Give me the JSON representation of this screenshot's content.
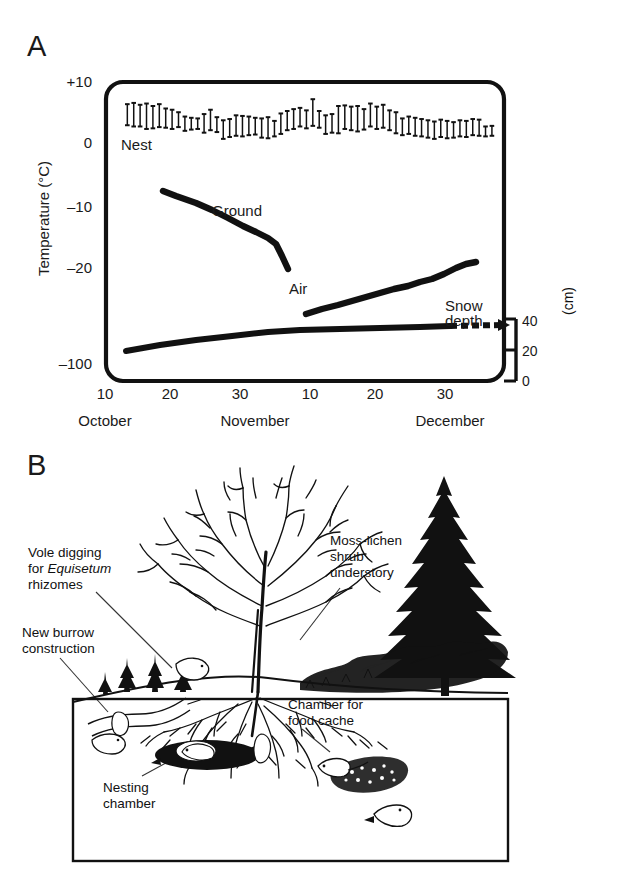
{
  "figure": {
    "panels": [
      {
        "id": "A",
        "letter": "A"
      },
      {
        "id": "B",
        "letter": "B"
      }
    ]
  },
  "panelA": {
    "letter": "A",
    "ylabel": "Temperature (°C)",
    "y_ticks": [
      "+10",
      "0",
      "–10",
      "–20",
      "–100"
    ],
    "x_ticks": [
      "10",
      "20",
      "30",
      "10",
      "20",
      "30"
    ],
    "x_months": [
      "October",
      "November",
      "December"
    ],
    "series_labels": {
      "nest": "Nest",
      "ground": "Ground",
      "air": "Air",
      "snow": "Snow depth"
    },
    "right_axis": {
      "unit": "(cm)",
      "ticks": [
        "40",
        "20",
        "0"
      ]
    }
  },
  "panelB": {
    "letter": "B",
    "labels": {
      "vole_digging_line1": "Vole digging",
      "vole_digging_line2_pre": "for ",
      "vole_digging_line2_em": "Equisetum",
      "vole_digging_line3": "rhizomes",
      "new_burrow_line1": "New burrow",
      "new_burrow_line2": "construction",
      "moss_line1": "Moss-lichen",
      "moss_line2": "shrub",
      "moss_line3": "understory",
      "chamber_line1": "Chamber for",
      "chamber_line2": "food cache",
      "nesting_line1": "Nesting",
      "nesting_line2": "chamber"
    }
  },
  "colors": {
    "ink": "#111111",
    "background": "#ffffff"
  },
  "chart_data": {
    "type": "line",
    "title": "",
    "xlabel": "",
    "ylabel": "Temperature (°C)",
    "ylim": [
      -100,
      10
    ],
    "y_tick_values": [
      10,
      0,
      -10,
      -20,
      -100
    ],
    "y_tick_labels": [
      "+10",
      "0",
      "–10",
      "–20",
      "–100"
    ],
    "x_tick_labels": [
      "10",
      "20",
      "30",
      "10",
      "20",
      "30"
    ],
    "x_tick_days": [
      10,
      20,
      30,
      41,
      51,
      61
    ],
    "x_month_labels": [
      "October",
      "November",
      "December"
    ],
    "xlim": [
      10,
      66
    ],
    "grid": false,
    "legend": "inline-annotations",
    "series": [
      {
        "name": "Nest",
        "type": "errorbar-range",
        "note": "daily minimum–maximum nest temperature, degrees C",
        "points": [
          {
            "x": 13.0,
            "low": 4.8,
            "high": 8.2
          },
          {
            "x": 13.9,
            "low": 4.6,
            "high": 8.4
          },
          {
            "x": 14.8,
            "low": 4.6,
            "high": 8.1
          },
          {
            "x": 15.7,
            "low": 4.2,
            "high": 8.3
          },
          {
            "x": 16.6,
            "low": 4.3,
            "high": 7.9
          },
          {
            "x": 17.5,
            "low": 4.5,
            "high": 8.2
          },
          {
            "x": 18.4,
            "low": 4.4,
            "high": 7.5
          },
          {
            "x": 19.3,
            "low": 4.2,
            "high": 7.3
          },
          {
            "x": 20.2,
            "low": 4.5,
            "high": 6.9
          },
          {
            "x": 21.1,
            "low": 3.9,
            "high": 6.2
          },
          {
            "x": 22.0,
            "low": 4.1,
            "high": 6.0
          },
          {
            "x": 22.9,
            "low": 4.2,
            "high": 5.9
          },
          {
            "x": 23.8,
            "low": 3.6,
            "high": 6.6
          },
          {
            "x": 24.7,
            "low": 4.0,
            "high": 7.3
          },
          {
            "x": 25.6,
            "low": 3.7,
            "high": 6.1
          },
          {
            "x": 26.5,
            "low": 2.6,
            "high": 5.6
          },
          {
            "x": 27.4,
            "low": 2.9,
            "high": 5.8
          },
          {
            "x": 28.3,
            "low": 3.1,
            "high": 6.4
          },
          {
            "x": 29.2,
            "low": 3.0,
            "high": 6.3
          },
          {
            "x": 30.1,
            "low": 3.2,
            "high": 6.2
          },
          {
            "x": 31.0,
            "low": 3.3,
            "high": 6.0
          },
          {
            "x": 31.9,
            "low": 2.8,
            "high": 5.9
          },
          {
            "x": 32.8,
            "low": 2.7,
            "high": 6.1
          },
          {
            "x": 33.7,
            "low": 3.0,
            "high": 5.5
          },
          {
            "x": 34.6,
            "low": 3.4,
            "high": 6.7
          },
          {
            "x": 35.5,
            "low": 4.0,
            "high": 7.1
          },
          {
            "x": 36.4,
            "low": 4.2,
            "high": 7.4
          },
          {
            "x": 37.3,
            "low": 4.6,
            "high": 7.6
          },
          {
            "x": 38.2,
            "low": 4.3,
            "high": 7.2
          },
          {
            "x": 39.1,
            "low": 4.7,
            "high": 9.0
          },
          {
            "x": 40.0,
            "low": 4.4,
            "high": 7.1
          },
          {
            "x": 40.9,
            "low": 3.4,
            "high": 6.4
          },
          {
            "x": 41.8,
            "low": 3.6,
            "high": 6.6
          },
          {
            "x": 42.7,
            "low": 3.5,
            "high": 7.9
          },
          {
            "x": 43.6,
            "low": 4.2,
            "high": 8.0
          },
          {
            "x": 44.5,
            "low": 4.0,
            "high": 7.8
          },
          {
            "x": 45.4,
            "low": 3.8,
            "high": 7.9
          },
          {
            "x": 46.3,
            "low": 4.1,
            "high": 7.4
          },
          {
            "x": 47.2,
            "low": 4.6,
            "high": 8.3
          },
          {
            "x": 48.1,
            "low": 4.2,
            "high": 7.8
          },
          {
            "x": 49.0,
            "low": 4.4,
            "high": 8.1
          },
          {
            "x": 49.9,
            "low": 4.0,
            "high": 7.2
          },
          {
            "x": 50.8,
            "low": 3.5,
            "high": 6.9
          },
          {
            "x": 51.7,
            "low": 3.2,
            "high": 5.9
          },
          {
            "x": 52.6,
            "low": 3.4,
            "high": 6.2
          },
          {
            "x": 53.5,
            "low": 3.1,
            "high": 6.0
          },
          {
            "x": 54.4,
            "low": 3.0,
            "high": 5.8
          },
          {
            "x": 55.3,
            "low": 2.8,
            "high": 5.6
          },
          {
            "x": 56.2,
            "low": 2.6,
            "high": 5.4
          },
          {
            "x": 57.1,
            "low": 2.9,
            "high": 5.7
          },
          {
            "x": 58.0,
            "low": 2.7,
            "high": 5.5
          },
          {
            "x": 58.9,
            "low": 2.8,
            "high": 5.3
          },
          {
            "x": 59.8,
            "low": 3.0,
            "high": 5.6
          },
          {
            "x": 60.7,
            "low": 2.9,
            "high": 5.5
          },
          {
            "x": 61.6,
            "low": 3.2,
            "high": 5.8
          },
          {
            "x": 62.5,
            "low": 3.1,
            "high": 5.7
          },
          {
            "x": 63.4,
            "low": 3.0,
            "high": 4.6
          },
          {
            "x": 64.3,
            "low": 3.1,
            "high": 4.7
          }
        ]
      },
      {
        "name": "Air",
        "type": "thick-line",
        "note": "air temperature, degrees C; gap in record in early November",
        "segments": [
          {
            "x": [
              18.0,
              20.5,
              24.0,
              28.0,
              31.5,
              34.0,
              35.0,
              36.0
            ],
            "y": [
              -9.8,
              -10.6,
              -11.8,
              -13.4,
              -15.2,
              -16.4,
              -18.0,
              -19.2
            ]
          },
          {
            "x": [
              38.5,
              41.0,
              44.0,
              47.0,
              50.0,
              53.0,
              56.0,
              59.0,
              61.5,
              63.5
            ],
            "y": [
              -23.3,
              -22.6,
              -21.8,
              -20.8,
              -20.1,
              -19.2,
              -18.3,
              -17.4,
              -16.6,
              -16.2
            ]
          }
        ]
      },
      {
        "name": "Snow depth",
        "type": "thick-line",
        "units": "cm",
        "right_axis": {
          "ticks": [
            40,
            20,
            0
          ],
          "ylim": [
            0,
            40
          ],
          "unit": "(cm)"
        },
        "note": "snow depth read on right-hand axis; dashed at far right",
        "x": [
          13.0,
          18.0,
          24.0,
          30.0,
          36.0,
          40.0,
          45.0,
          50.0,
          56.0,
          61.0
        ],
        "y_cm": [
          2.0,
          5.5,
          9.0,
          12.5,
          15.5,
          17.5,
          18.2,
          18.8,
          19.4,
          20.0
        ],
        "dashed_tail": {
          "x": [
            61.0,
            66.0
          ],
          "y_cm": [
            20.0,
            20.4
          ]
        }
      }
    ],
    "annotations": [
      {
        "text": "Nest",
        "x": 17.0,
        "y": 2.2
      },
      {
        "text": "Ground",
        "x": 28.0,
        "y": -7.0
      },
      {
        "text": "Air",
        "x": 36.5,
        "y": -16.5
      },
      {
        "text": "Snow depth",
        "x": 56.0,
        "y": -20.5
      }
    ]
  }
}
